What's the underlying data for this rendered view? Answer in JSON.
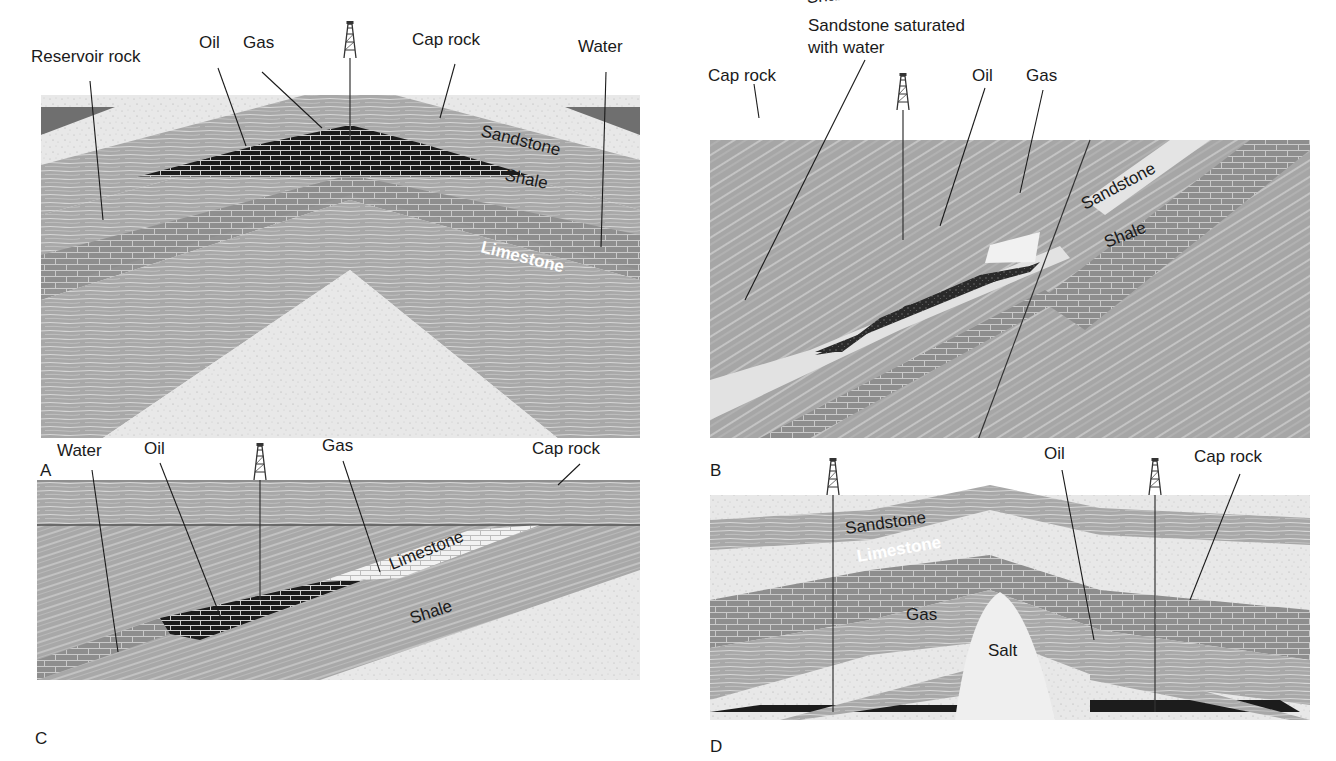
{
  "figure": {
    "panels": [
      {
        "id": "A",
        "letter": "A",
        "labels": {
          "reservoir_rock": "Reservoir rock",
          "oil": "Oil",
          "gas": "Gas",
          "cap_rock": "Cap rock",
          "water": "Water",
          "sandstone": "Sandstone",
          "shale": "Shale",
          "limestone": "Limestone"
        }
      },
      {
        "id": "B",
        "letter": "B",
        "labels": {
          "sandstone_saturated_line1": "Sandstone saturated",
          "sandstone_saturated_line2": "with water",
          "cap_rock": "Cap rock",
          "oil": "Oil",
          "gas": "Gas",
          "sandstone": "Sandstone",
          "shale": "Shale"
        }
      },
      {
        "id": "C",
        "letter": "C",
        "labels": {
          "water": "Water",
          "oil": "Oil",
          "gas": "Gas",
          "cap_rock": "Cap rock",
          "limestone": "Limestone",
          "shale": "Shale"
        }
      },
      {
        "id": "D",
        "letter": "D",
        "labels": {
          "oil": "Oil",
          "cap_rock": "Cap rock",
          "sandstone": "Sandstone",
          "limestone": "Limestone",
          "shale": "Shale",
          "gas": "Gas",
          "salt": "Salt"
        }
      }
    ],
    "colors": {
      "shale": "#a9a9a9",
      "shale_streak": "#d9d9d9",
      "sandstone": "#e6e6e6",
      "limestone": "#8c8c8c",
      "oil": "#1c1c1c",
      "gas": "#f2f2f2",
      "cap_dark": "#6e6e6e"
    }
  }
}
